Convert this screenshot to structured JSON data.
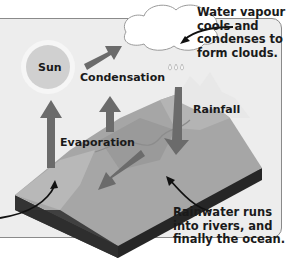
{
  "diagram": {
    "colors": {
      "panel_bg": "#ededed",
      "panel_border": "#8a8a8a",
      "arrow": "#6b6b6b",
      "land_top": "#a8a8a8",
      "land_side": "#2a2a2a",
      "sun_core": "#c8c8c8",
      "text": "#1a1a1a"
    },
    "nodes": {
      "sun": "Sun",
      "condensation": "Condensation",
      "evaporation": "Evaporation",
      "rainfall": "Rainfall"
    },
    "callouts": {
      "clouds": [
        "Water vapour",
        "cools and",
        "condenses to",
        "form clouds."
      ],
      "runoff": [
        "Rainwater runs",
        "into rivers, and",
        "finally the ocean."
      ]
    },
    "edges": [
      {
        "from": "evaporation",
        "to": "condensation",
        "label": "Condensation"
      },
      {
        "from": "cloud",
        "to": "land",
        "label": "Rainfall"
      },
      {
        "from": "land",
        "to": "ocean",
        "label": "Runoff"
      }
    ]
  }
}
